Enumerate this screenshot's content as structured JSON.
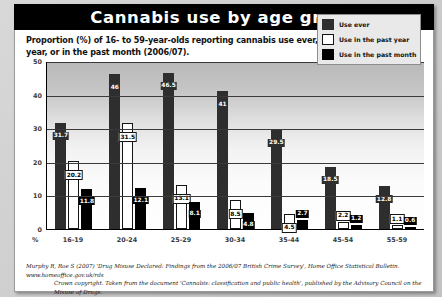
{
  "banner": {
    "title": "Cannabis use by age group"
  },
  "subtitle": "Proportion (%) of 16- to 59-year-olds reporting cannabis use ever, in the past year, or in the past month (2006/07).",
  "axis": {
    "percent_symbol": "%",
    "yticks": [
      "0",
      "10",
      "20",
      "30",
      "40",
      "50"
    ]
  },
  "legend": {
    "items": [
      {
        "label": "Use ever",
        "color": "#2e2e2e"
      },
      {
        "label": "Use in the past year",
        "color": "#ffffff"
      },
      {
        "label": "Use in the past month",
        "color": "#000000"
      }
    ]
  },
  "footer": {
    "line1": "Murphy R, Roe S (2007) 'Drug Misuse Declared: Findings from the 2006/07 British Crime Survey', Home Office Statistical Bulletin. www.homeoffice.gov.uk/rds",
    "line2": "Crown copyright. Taken from the document 'Cannabis: classification and public health', published by the Advisory Council on the Misuse of Drugs."
  },
  "chart_data": {
    "type": "bar",
    "title": "Cannabis use by age group",
    "subtitle": "Proportion (%) of 16- to 59-year-olds reporting cannabis use ever, in the past year, or in the past month (2006/07).",
    "xlabel": "%",
    "ylabel": "",
    "ylim": [
      0,
      50
    ],
    "yticks": [
      0,
      10,
      20,
      30,
      40,
      50
    ],
    "grid": true,
    "legend_position": "top-right",
    "categories": [
      "16-19",
      "20-24",
      "25-29",
      "30-34",
      "35-44",
      "45-54",
      "55-59"
    ],
    "series": [
      {
        "name": "Use ever",
        "color": "#2e2e2e",
        "values": [
          31.7,
          46,
          46.5,
          41,
          29.5,
          18.5,
          12.8
        ]
      },
      {
        "name": "Use in the past year",
        "color": "#ffffff",
        "values": [
          20.2,
          31.5,
          13.1,
          8.5,
          4.5,
          2.2,
          1.1
        ]
      },
      {
        "name": "Use in the past month",
        "color": "#000000",
        "values": [
          11.8,
          12.1,
          8.1,
          4.8,
          2.7,
          1.2,
          0.6
        ]
      }
    ]
  }
}
